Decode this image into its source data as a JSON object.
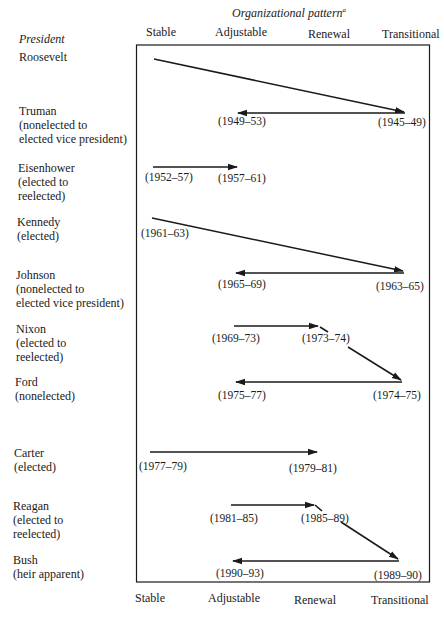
{
  "title": {
    "text": "Organizational pattern",
    "footnote_marker": "a"
  },
  "row_header": "President",
  "columns": {
    "top": [
      "Stable",
      "Adjustable",
      "Renewal",
      "Transitional"
    ],
    "bottom": [
      "Stable",
      "Adjustable",
      "Renewal",
      "Transitional"
    ]
  },
  "presidents": [
    {
      "name": "Roosevelt",
      "lines": []
    },
    {
      "name": "Truman",
      "lines": [
        "(nonelected to",
        "elected vice president)"
      ]
    },
    {
      "name": "Eisenhower",
      "lines": [
        "(elected to",
        "reelected)"
      ]
    },
    {
      "name": "Kennedy",
      "lines": [
        "(elected)"
      ]
    },
    {
      "name": "Johnson",
      "lines": [
        "(nonelected to",
        "elected vice president)"
      ]
    },
    {
      "name": "Nixon",
      "lines": [
        "(elected to",
        "reelected)"
      ]
    },
    {
      "name": "Ford",
      "lines": [
        "(nonelected)"
      ]
    },
    {
      "name": "Carter",
      "lines": [
        "(elected)"
      ]
    },
    {
      "name": "Reagan",
      "lines": [
        "(elected to",
        "reelected)"
      ]
    },
    {
      "name": "Bush",
      "lines": [
        "(heir apparent)"
      ]
    }
  ],
  "periods": [
    {
      "id": "truman_1",
      "label": "(1945–49)",
      "pattern": "Transitional"
    },
    {
      "id": "truman_2",
      "label": "(1949–53)",
      "pattern": "Adjustable"
    },
    {
      "id": "eisenhower_1",
      "label": "(1952–57)",
      "pattern": "Stable"
    },
    {
      "id": "eisenhower_2",
      "label": "(1957–61)",
      "pattern": "Adjustable"
    },
    {
      "id": "kennedy_1",
      "label": "(1961–63)",
      "pattern": "Stable"
    },
    {
      "id": "johnson_1",
      "label": "(1963–65)",
      "pattern": "Transitional"
    },
    {
      "id": "johnson_2",
      "label": "(1965–69)",
      "pattern": "Adjustable"
    },
    {
      "id": "nixon_1",
      "label": "(1969–73)",
      "pattern": "Adjustable"
    },
    {
      "id": "nixon_2",
      "label": "(1973–74)",
      "pattern": "Renewal"
    },
    {
      "id": "ford_1",
      "label": "(1974–75)",
      "pattern": "Transitional"
    },
    {
      "id": "ford_2",
      "label": "(1975–77)",
      "pattern": "Adjustable"
    },
    {
      "id": "carter_1",
      "label": "(1977–79)",
      "pattern": "Stable"
    },
    {
      "id": "carter_2",
      "label": "(1979–81)",
      "pattern": "Renewal"
    },
    {
      "id": "reagan_1",
      "label": "(1981–85)",
      "pattern": "Adjustable"
    },
    {
      "id": "reagan_2",
      "label": "(1985–89)",
      "pattern": "Renewal"
    },
    {
      "id": "bush_1",
      "label": "(1989–90)",
      "pattern": "Transitional"
    },
    {
      "id": "bush_2",
      "label": "(1990–93)",
      "pattern": "Adjustable"
    }
  ],
  "transitions": [
    {
      "from": "Roosevelt (Stable)",
      "to": "(1945–49) Transitional"
    },
    {
      "from": "(1945–49) Transitional",
      "to": "(1949–53) Adjustable"
    },
    {
      "from": "(1952–57) Stable",
      "to": "(1957–61) Adjustable"
    },
    {
      "from": "(1961–63) Stable",
      "to": "(1963–65) Transitional"
    },
    {
      "from": "(1963–65) Transitional",
      "to": "(1965–69) Adjustable"
    },
    {
      "from": "(1969–73) Adjustable",
      "to": "(1973–74) Renewal"
    },
    {
      "from": "(1973–74) Renewal",
      "to": "(1974–75) Transitional"
    },
    {
      "from": "(1974–75) Transitional",
      "to": "(1975–77) Adjustable"
    },
    {
      "from": "(1977–79) Stable",
      "to": "(1979–81) Renewal"
    },
    {
      "from": "(1981–85) Adjustable",
      "to": "(1985–89) Renewal"
    },
    {
      "from": "(1985–89) Renewal",
      "to": "(1989–90) Transitional"
    },
    {
      "from": "(1989–90) Transitional",
      "to": "(1990–93) Adjustable"
    }
  ],
  "colors": {
    "ink": "#1a1a1a",
    "background": "#ffffff"
  }
}
